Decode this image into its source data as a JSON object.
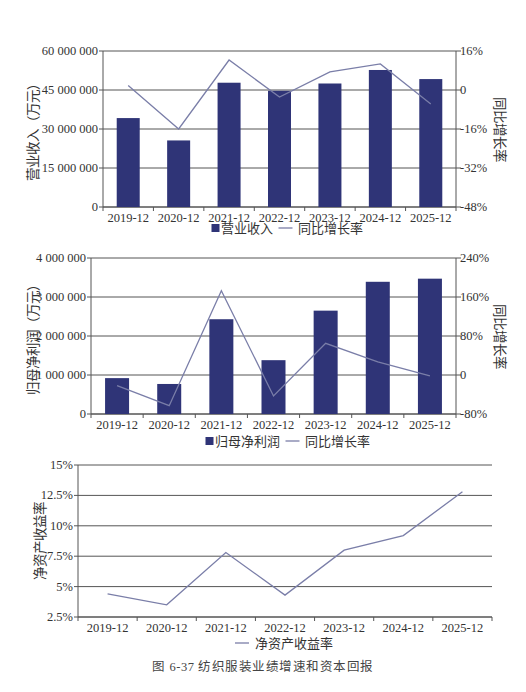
{
  "colors": {
    "bar": "#2f3477",
    "line": "#7a7ea8",
    "axis": "#555555",
    "grid": "#555555",
    "text": "#333333"
  },
  "caption": "图 6-37    纺织服装业绩增速和资本回报",
  "chart_data": [
    {
      "type": "bar",
      "id": "revenue",
      "title": "",
      "categories": [
        "2019-12",
        "2020-12",
        "2021-12",
        "2022-12",
        "2023-12",
        "2024-12",
        "2025-12"
      ],
      "series": [
        {
          "name": "营业收入",
          "type": "bar",
          "axis": "left",
          "values": [
            34200000,
            25600000,
            47800000,
            44700000,
            47500000,
            52700000,
            49200000
          ]
        },
        {
          "name": "同比增长率",
          "type": "line",
          "axis": "right",
          "unit": "%",
          "values": [
            1.8,
            -16.0,
            12.3,
            -2.9,
            7.4,
            10.7,
            -5.7
          ]
        }
      ],
      "ylabel": "营业收入（万元）",
      "ylabel_right": "同比增长率",
      "ylim": [
        0,
        60000000
      ],
      "yticks": [
        0,
        15000000,
        30000000,
        45000000,
        60000000
      ],
      "ytick_labels": [
        "0",
        "15 000 000",
        "30 000 000",
        "45 000 000",
        "60 000 000"
      ],
      "ylim_right": [
        -48,
        16
      ],
      "yticks_right": [
        -48,
        -32,
        -16,
        0,
        16
      ],
      "ytick_labels_right": [
        "-48%",
        "-32%",
        "-16%",
        "0",
        "16%"
      ],
      "grid": true,
      "legend": [
        "■营业收入",
        "— 同比增长率"
      ],
      "legend_position": "bottom"
    },
    {
      "type": "bar",
      "id": "net-profit",
      "title": "",
      "categories": [
        "2019-12",
        "2020-12",
        "2021-12",
        "2022-12",
        "2023-12",
        "2024-12",
        "2025-12"
      ],
      "series": [
        {
          "name": "归母净利润",
          "type": "bar",
          "axis": "left",
          "values": [
            920000,
            770000,
            2430000,
            1380000,
            2650000,
            3390000,
            3470000
          ]
        },
        {
          "name": "同比增长率",
          "type": "line",
          "axis": "right",
          "unit": "%",
          "values": [
            -22,
            -63,
            173,
            -43,
            65,
            27,
            -2
          ]
        }
      ],
      "ylabel": "归母净利润（万元）",
      "ylabel_right": "同比增长率",
      "ylim": [
        0,
        4000000
      ],
      "yticks": [
        0,
        1000000,
        2000000,
        3000000,
        4000000
      ],
      "ytick_labels": [
        "0",
        "1 000 000",
        "2 000 000",
        "3 000 000",
        "4 000 000"
      ],
      "ylim_right": [
        -80,
        240
      ],
      "yticks_right": [
        -80,
        0,
        80,
        160,
        240
      ],
      "ytick_labels_right": [
        "-80%",
        "0",
        "80%",
        "160%",
        "240%"
      ],
      "grid": true,
      "legend": [
        "■归母净利润",
        "— 同比增长率"
      ],
      "legend_position": "bottom"
    },
    {
      "type": "line",
      "id": "roe",
      "title": "",
      "categories": [
        "2019-12",
        "2020-12",
        "2021-12",
        "2022-12",
        "2023-12",
        "2024-12",
        "2025-12"
      ],
      "series": [
        {
          "name": "净资产收益率",
          "type": "line",
          "axis": "left",
          "unit": "%",
          "values": [
            4.4,
            3.5,
            7.8,
            4.3,
            8.0,
            9.2,
            12.8
          ]
        }
      ],
      "ylabel": "净资产收益率",
      "ylim": [
        2.5,
        15
      ],
      "yticks": [
        2.5,
        5,
        7.5,
        10,
        12.5,
        15
      ],
      "ytick_labels": [
        "2.5%",
        "5%",
        "7.5%",
        "10%",
        "12.5%",
        "15%"
      ],
      "grid": true,
      "legend": [
        "— 净资产收益率"
      ],
      "legend_position": "bottom"
    }
  ]
}
